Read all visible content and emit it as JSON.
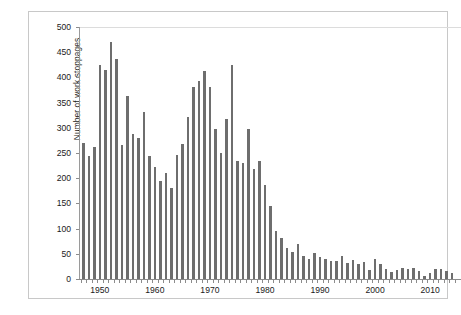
{
  "chart_data": {
    "type": "bar",
    "title": "",
    "subtitle": "",
    "xlabel": "",
    "ylabel": "Number of work stoppages",
    "ylim": [
      0,
      500
    ],
    "ytick_labels": [
      "0",
      "50",
      "100",
      "150",
      "200",
      "250",
      "300",
      "350",
      "400",
      "450",
      "500"
    ],
    "ytick_values": [
      0,
      50,
      100,
      150,
      200,
      250,
      300,
      350,
      400,
      450,
      500
    ],
    "xtick_labels": [
      "1950",
      "1960",
      "1970",
      "1980",
      "1990",
      "2000",
      "2010"
    ],
    "xtick_values": [
      1950,
      1960,
      1970,
      1980,
      1990,
      2000,
      2010
    ],
    "xlim": [
      1946,
      2015
    ],
    "grid": "top-only",
    "legend": "none",
    "bar_color": "#6e6e6e",
    "categories": [
      1947,
      1948,
      1949,
      1950,
      1951,
      1952,
      1953,
      1954,
      1955,
      1956,
      1957,
      1958,
      1959,
      1960,
      1961,
      1962,
      1963,
      1964,
      1965,
      1966,
      1967,
      1968,
      1969,
      1970,
      1971,
      1972,
      1973,
      1974,
      1975,
      1976,
      1977,
      1978,
      1979,
      1980,
      1981,
      1982,
      1983,
      1984,
      1985,
      1986,
      1987,
      1988,
      1989,
      1990,
      1991,
      1992,
      1993,
      1994,
      1995,
      1996,
      1997,
      1998,
      1999,
      2000,
      2001,
      2002,
      2003,
      2004,
      2005,
      2006,
      2007,
      2008,
      2009,
      2010,
      2011,
      2012,
      2013,
      2014
    ],
    "values": [
      270,
      245,
      262,
      424,
      415,
      470,
      437,
      265,
      363,
      287,
      279,
      332,
      245,
      222,
      195,
      211,
      181,
      246,
      268,
      321,
      381,
      392,
      412,
      381,
      298,
      250,
      317,
      424,
      235,
      231,
      298,
      219,
      235,
      187,
      145,
      96,
      81,
      62,
      54,
      69,
      46,
      40,
      51,
      44,
      40,
      35,
      35,
      45,
      31,
      37,
      29,
      34,
      17,
      39,
      29,
      19,
      14,
      17,
      22,
      20,
      21,
      15,
      5,
      11,
      19,
      19,
      15,
      11
    ]
  }
}
